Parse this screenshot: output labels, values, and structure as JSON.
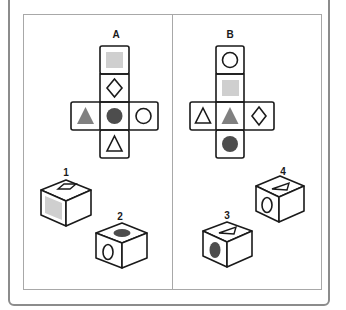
{
  "panels": [
    {
      "label": "A",
      "net": {
        "top": "gray-square",
        "upper": "outline-diamond",
        "left": "gray-triangle",
        "center": "dark-circle",
        "right": "outline-circle",
        "bottom": "outline-triangle"
      },
      "cubes": [
        {
          "number": "1",
          "top": "outline-diamond",
          "left": "gray-square",
          "right": "blank"
        },
        {
          "number": "2",
          "top": "dark-circle",
          "left": "outline-circle",
          "right": "blank"
        }
      ]
    },
    {
      "label": "B",
      "net": {
        "top": "outline-circle",
        "upper": "gray-square",
        "left": "outline-triangle",
        "center": "gray-triangle",
        "right": "outline-diamond",
        "bottom": "dark-circle"
      },
      "cubes": [
        {
          "number": "3",
          "top": "outline-triangle",
          "left": "dark-circle",
          "right": "blank"
        },
        {
          "number": "4",
          "top": "outline-triangle",
          "left": "outline-circle",
          "right": "blank"
        }
      ]
    }
  ],
  "colors": {
    "stroke": "#1a1a1a",
    "gray_square": "#cfcfcf",
    "gray_triangle": "#808080",
    "dark_circle": "#4d4d4d",
    "frame": "#8c8c8c",
    "inner_border": "#a8a8a8"
  }
}
